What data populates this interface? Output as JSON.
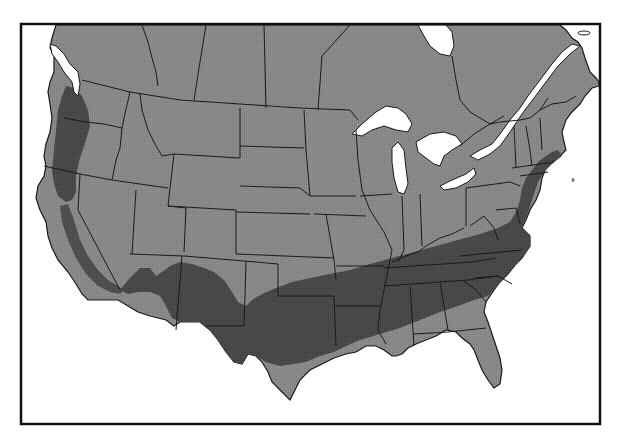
{
  "map": {
    "type": "range-map",
    "region": "North America (United States and southern Canada)",
    "colors": {
      "background": "#ffffff",
      "land": "#8a8a8a",
      "range_shaded": "#4a4a4a",
      "range_edge": "#6a6a6a",
      "borders": "#1a1a1a",
      "water": "#ffffff",
      "frame": "#111111"
    },
    "frame": {
      "x": 20,
      "y": 23,
      "width": 581,
      "height": 402
    },
    "shaded_regions": [
      {
        "name": "pacific-northwest-coastal-range",
        "description": "Western Washington, western Oregon, northern California coast"
      },
      {
        "name": "california-sierra-band",
        "description": "Arc through central California toward southern Nevada/Arizona"
      },
      {
        "name": "southern-us-range",
        "description": "Southern Arizona/New Mexico across Texas, Oklahoma, the South to Virginia and the Atlantic coast up to New England"
      }
    ],
    "legend": null,
    "labels": []
  }
}
